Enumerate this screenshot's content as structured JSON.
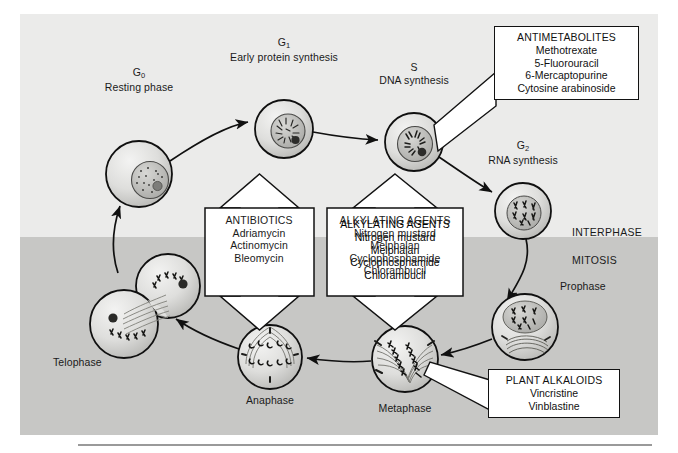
{
  "figure": {
    "bands": {
      "interphase_label": "INTERPHASE",
      "mitosis_label": "MITOSIS"
    },
    "background": {
      "interphase_color": "#ebebea",
      "mitosis_color": "#c7c7c5",
      "page_color": "#ffffff",
      "line_color": "#121212"
    }
  },
  "phases": [
    {
      "id": "g0",
      "name": "G",
      "subscript": "0",
      "description": "Resting phase",
      "label_x": 119,
      "label_y": 60,
      "cx": 119,
      "cy": 160,
      "r": 33
    },
    {
      "id": "g1",
      "name": "G",
      "subscript": "1",
      "description": "Early protein synthesis",
      "label_x": 264,
      "label_y": 30,
      "cx": 264,
      "cy": 115,
      "r": 29
    },
    {
      "id": "s",
      "name": "S",
      "subscript": "",
      "description": "DNA synthesis",
      "label_x": 394,
      "label_y": 55,
      "cx": 394,
      "cy": 128,
      "r": 29
    },
    {
      "id": "g2",
      "name": "G",
      "subscript": "2",
      "description": "RNA synthesis",
      "label_x": 503,
      "label_y": 133,
      "cx": 503,
      "cy": 197,
      "r": 28
    },
    {
      "id": "prophase",
      "name": "Prophase",
      "subscript": "",
      "description": "",
      "label_x": 562,
      "label_y": 272,
      "cx": 505,
      "cy": 313,
      "r": 33
    },
    {
      "id": "metaphase",
      "name": "Metaphase",
      "subscript": "",
      "description": "",
      "label_x": 385,
      "label_y": 393,
      "cx": 385,
      "cy": 345,
      "r": 33
    },
    {
      "id": "anaphase",
      "name": "Anaphase",
      "subscript": "",
      "description": "",
      "label_x": 250,
      "label_y": 385,
      "cx": 250,
      "cy": 343,
      "r": 32
    },
    {
      "id": "telophase",
      "name": "Telophase",
      "subscript": "",
      "description": "",
      "label_x": 76,
      "label_y": 348,
      "cx": 121,
      "cy": 292,
      "r": 33
    }
  ],
  "callouts": {
    "antimetabolites": {
      "title": "ANTIMETABOLITES",
      "items": [
        "Methotrexate",
        "5-Fluorouracil",
        "6-Mercaptopurine",
        "Cytosine arabinoside"
      ]
    },
    "antibiotics": {
      "title": "ANTIBIOTICS",
      "items": [
        "Adriamycin",
        "Actinomycin",
        "Bleomycin"
      ]
    },
    "alkylating_agents": {
      "title": "ALKYLATING AGENTS",
      "items": [
        "Nitrogen mustard",
        "Melphalan",
        "Cyclophosphamide",
        "Chlorambucil"
      ]
    },
    "plant_alkaloids": {
      "title": "PLANT ALKALOIDS",
      "items": [
        "Vincristine",
        "Vinblastine"
      ]
    }
  }
}
